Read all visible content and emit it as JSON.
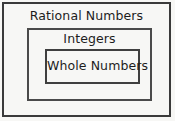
{
  "diagram": {
    "type": "nested-sets",
    "background_color": "#f7f7f5",
    "border_color": "#3a3a3a",
    "text_color": "#1d1d1d",
    "sets": [
      {
        "id": "rational-numbers",
        "label": "Rational Numbers",
        "level": 0
      },
      {
        "id": "integers",
        "label": "Integers",
        "level": 1
      },
      {
        "id": "whole-numbers",
        "label": "Whole Numbers",
        "level": 2
      }
    ]
  }
}
